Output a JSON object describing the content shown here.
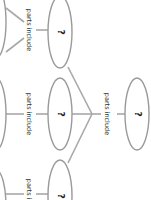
{
  "diagram": {
    "type": "concept-map",
    "orientation": "rotated-90-clockwise",
    "root": {
      "label": "?",
      "link_label": "parts include"
    },
    "children": [
      {
        "label": "?",
        "link_label": "parts include"
      },
      {
        "label": "?",
        "link_label": "parts include"
      },
      {
        "label": "?",
        "link_label": "parts include"
      }
    ],
    "colors": {
      "stroke": "#9a9a9a",
      "line": "#a8a8a8",
      "text": "#222222",
      "background": "#ffffff"
    }
  }
}
